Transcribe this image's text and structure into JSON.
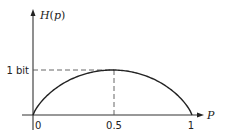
{
  "chart_data": {
    "type": "line",
    "title": "",
    "xlabel": "P",
    "ylabel": "H(p)",
    "x_ticks": [
      "0",
      "0.5",
      "1"
    ],
    "y_ticks": [
      "1 bit"
    ],
    "xlim": [
      0,
      1
    ],
    "ylim": [
      0,
      1
    ],
    "grid": false,
    "legend": null,
    "series": [
      {
        "name": "H(p)",
        "x": [
          0,
          0.05,
          0.1,
          0.2,
          0.3,
          0.4,
          0.5,
          0.6,
          0.7,
          0.8,
          0.9,
          0.95,
          1
        ],
        "values": [
          0,
          0.286,
          0.469,
          0.722,
          0.881,
          0.971,
          1.0,
          0.971,
          0.881,
          0.722,
          0.469,
          0.286,
          0
        ]
      }
    ],
    "annotations": [
      {
        "type": "dashed-horizontal",
        "y": 1,
        "label": "1 bit"
      },
      {
        "type": "dashed-vertical",
        "x": 0.5
      }
    ]
  },
  "labels": {
    "y_axis": "H(p)",
    "x_axis": "P",
    "y_tick_1bit": "1 bit",
    "x_tick_0": "0",
    "x_tick_05": "0.5",
    "x_tick_1": "1"
  },
  "colors": {
    "line": "#222222",
    "axis": "#333333",
    "dash": "#555555",
    "background": "#ffffff"
  }
}
